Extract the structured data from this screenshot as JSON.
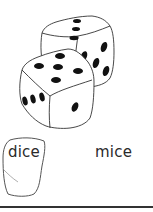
{
  "picture": {
    "subject": "dice-icon",
    "description": "two dice"
  },
  "word_choices": [
    {
      "label": "dice",
      "selected": true
    },
    {
      "label": "mice",
      "selected": false
    }
  ],
  "colors": {
    "ink": "#2a2a2a",
    "pip": "#111111",
    "background": "#ffffff"
  }
}
